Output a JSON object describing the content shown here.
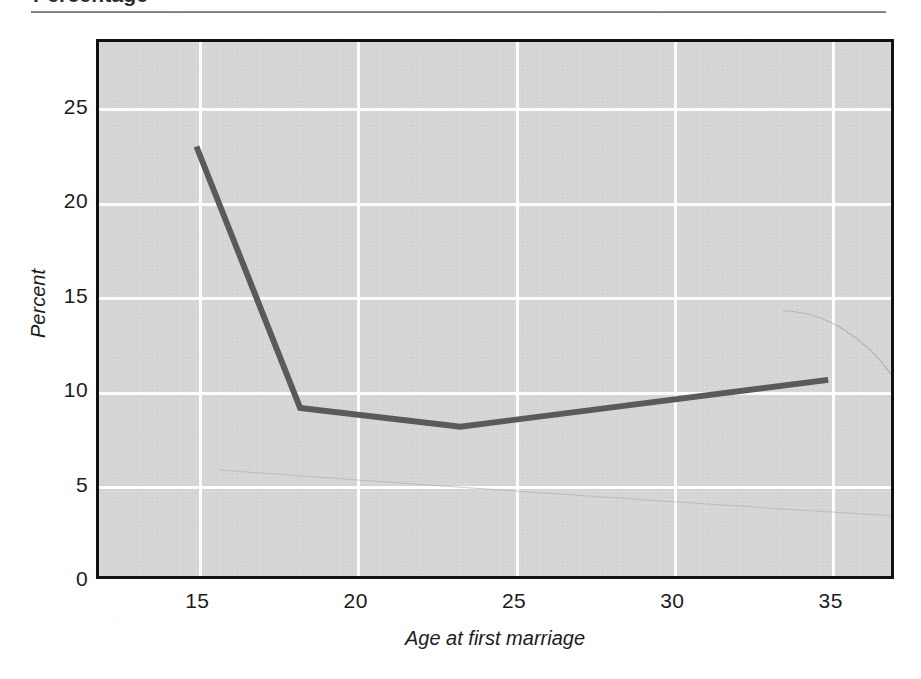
{
  "page": {
    "heading": "Percentage",
    "background_color": "#ffffff"
  },
  "chart": {
    "plot_background_color": "#d6d6d6",
    "grid_color": "#fdfdfd",
    "frame_color": "#111111",
    "line_color": "#5a5a5a"
  },
  "chart_data": {
    "type": "line",
    "title": "Percentage",
    "xlabel": "Age at first marriage",
    "ylabel": "Percent",
    "xlim": [
      11.8,
      37.0
    ],
    "ylim": [
      0,
      28.6
    ],
    "xticks": [
      15,
      20,
      25,
      30,
      35
    ],
    "yticks": [
      0,
      5,
      10,
      15,
      20,
      25
    ],
    "xtick_labels": [
      "15",
      "20",
      "25",
      "30",
      "35"
    ],
    "ytick_labels": [
      "0",
      "5",
      "10",
      "15",
      "20",
      "25"
    ],
    "grid": true,
    "legend": "none",
    "series": [
      {
        "name": "Percent by age at first marriage",
        "x": [
          14.9,
          18.2,
          23.3,
          35.0
        ],
        "values": [
          23.0,
          9.0,
          8.0,
          10.5
        ]
      }
    ]
  }
}
